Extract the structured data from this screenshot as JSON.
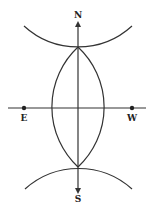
{
  "diagram": {
    "type": "compass-construction",
    "labels": {
      "north": "N",
      "south": "S",
      "east": "E",
      "west": "W"
    },
    "colors": {
      "stroke": "#333333",
      "text": "#222222",
      "background": "#ffffff"
    }
  }
}
